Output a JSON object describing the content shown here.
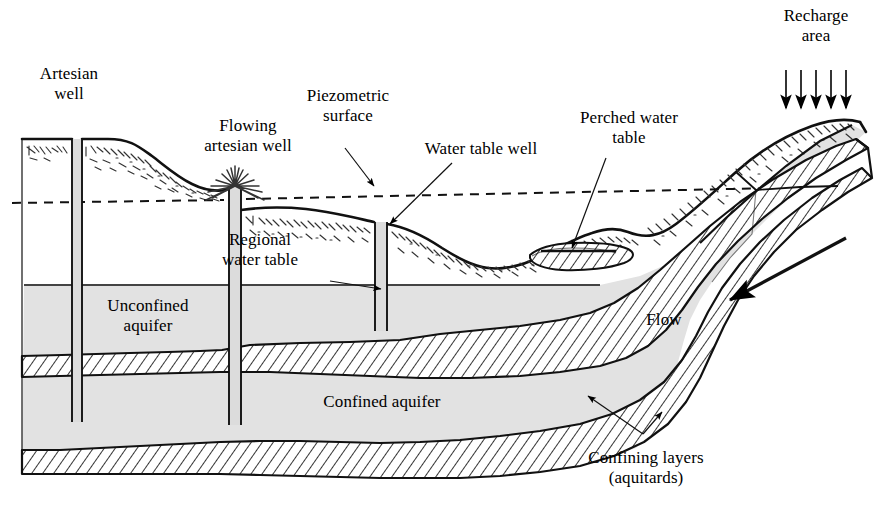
{
  "figure": {
    "kind": "hydrogeology-cross-section",
    "background_color": "#ffffff",
    "line_color": "#000000",
    "aquifer_fill": "#e2e2e2",
    "aquitard_fill": "#ffffff",
    "well_fill": "#dcdcdc"
  },
  "labels": {
    "artesian_well": "Artesian\nwell",
    "flowing_artesian_well": "Flowing\nartesian well",
    "piezometric_surface": "Piezometric\nsurface",
    "water_table_well": "Water table well",
    "perched_water_table": "Perched water\ntable",
    "recharge_area": "Recharge\narea",
    "regional_water_table": "Regional\nwater table",
    "unconfined_aquifer": "Unconfined\naquifer",
    "confined_aquifer": "Confined aquifer",
    "flow": "Flow",
    "confining_layers": "Confining layers\n(aquitards)"
  },
  "features": {
    "wells": [
      {
        "name": "artesian-well",
        "x_left": 72,
        "x_right": 82,
        "top": 139,
        "bottom": 422,
        "flowing": false
      },
      {
        "name": "flowing-artesian-well",
        "x_left": 229,
        "x_right": 241,
        "top": 186,
        "bottom": 425,
        "flowing": true
      },
      {
        "name": "water-table-well",
        "x_left": 375,
        "x_right": 387,
        "top": 222,
        "bottom": 331,
        "flowing": false
      }
    ],
    "recharge_arrows": {
      "count": 5,
      "x_start": 785,
      "x_step": 15,
      "y_top": 70,
      "y_bottom": 112
    },
    "flow_arrow": {
      "from": [
        846,
        238
      ],
      "to": [
        727,
        302
      ]
    },
    "piezometric_surface_line": {
      "style": "dashed",
      "x_start": 12,
      "y_start": 202,
      "x_end": 778,
      "y_end": 188
    },
    "regional_water_table_line": {
      "style": "solid",
      "x_start": 24,
      "y": 285,
      "x_end": 600
    }
  },
  "leaders": [
    {
      "name": "piezometric-surface-leader",
      "from": [
        348,
        155
      ],
      "to": [
        375,
        186
      ]
    },
    {
      "name": "water-table-well-leader",
      "from": [
        450,
        165
      ],
      "to": [
        389,
        224
      ]
    },
    {
      "name": "perched-water-table-leader",
      "from": [
        604,
        156
      ],
      "to": [
        570,
        250
      ]
    },
    {
      "name": "regional-water-table-leader",
      "from": [
        330,
        280
      ],
      "to": [
        382,
        288
      ]
    },
    {
      "name": "confining-layer-upper-leader",
      "from": [
        643,
        434
      ],
      "to": [
        587,
        397
      ]
    },
    {
      "name": "confining-layer-lower-leader",
      "from": [
        643,
        434
      ],
      "to": [
        660,
        412
      ]
    }
  ]
}
